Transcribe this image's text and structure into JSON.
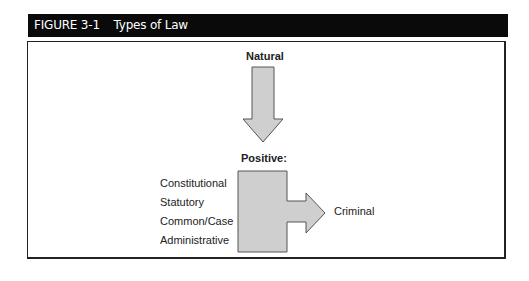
{
  "figure": {
    "number": "FIGURE 3-1",
    "title": "Types of Law"
  },
  "diagram": {
    "top_node": "Natural",
    "middle_node": "Positive:",
    "sources": [
      "Constitutional",
      "Statutory",
      "Common/Case",
      "Administrative"
    ],
    "result_node": "Criminal",
    "shape_fill": "#cfcfcf",
    "shape_stroke": "#555555"
  }
}
